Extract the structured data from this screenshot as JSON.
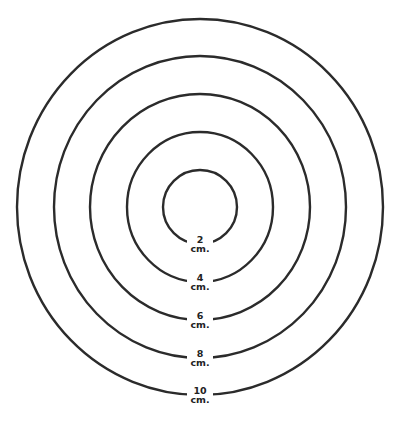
{
  "diagram": {
    "type": "concentric-circles",
    "center": {
      "x": 200,
      "y": 207
    },
    "stroke_color": "#2b2b2b",
    "rings": [
      {
        "value": "2",
        "unit": "cm.",
        "rx": 37,
        "ry": 37
      },
      {
        "value": "4",
        "unit": "cm.",
        "rx": 73,
        "ry": 75
      },
      {
        "value": "6",
        "unit": "cm.",
        "rx": 110,
        "ry": 113
      },
      {
        "value": "8",
        "unit": "cm.",
        "rx": 146,
        "ry": 151
      },
      {
        "value": "10",
        "unit": "cm.",
        "rx": 183,
        "ry": 188
      }
    ]
  }
}
